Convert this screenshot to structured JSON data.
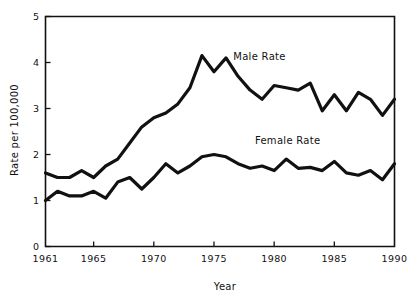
{
  "chart_data": {
    "type": "line",
    "title": "",
    "xlabel": "Year",
    "ylabel": "Rate per 100,000",
    "xlim": [
      1961,
      1990
    ],
    "ylim": [
      0,
      5
    ],
    "grid": false,
    "legend_position": "inline-annotation",
    "x_ticks": [
      "1961",
      "1965",
      "1970",
      "1975",
      "1980",
      "1985",
      "1990"
    ],
    "x_tick_values": [
      1961,
      1965,
      1970,
      1975,
      1980,
      1985,
      1990
    ],
    "y_ticks": [
      "0",
      "1",
      "2",
      "3",
      "4",
      "5"
    ],
    "y_tick_values": [
      0,
      1,
      2,
      3,
      4,
      5
    ],
    "x": [
      1961,
      1962,
      1963,
      1964,
      1965,
      1966,
      1967,
      1968,
      1969,
      1970,
      1971,
      1972,
      1973,
      1974,
      1975,
      1976,
      1977,
      1978,
      1979,
      1980,
      1981,
      1982,
      1983,
      1984,
      1985,
      1986,
      1987,
      1988,
      1989,
      1990
    ],
    "series": [
      {
        "name": "Male Rate",
        "label": "Male Rate",
        "label_x": 1976.6,
        "label_y": 4.05,
        "values": [
          1.6,
          1.5,
          1.5,
          1.65,
          1.5,
          1.75,
          1.9,
          2.25,
          2.6,
          2.8,
          2.9,
          3.1,
          3.45,
          4.15,
          3.8,
          4.1,
          3.7,
          3.4,
          3.2,
          3.5,
          3.45,
          3.4,
          3.55,
          2.95,
          3.3,
          2.95,
          3.35,
          3.2,
          2.85,
          3.2
        ]
      },
      {
        "name": "Female Rate",
        "label": "Female Rate",
        "label_x": 1978.4,
        "label_y": 2.22,
        "values": [
          1.0,
          1.2,
          1.1,
          1.1,
          1.2,
          1.05,
          1.4,
          1.5,
          1.25,
          1.5,
          1.8,
          1.6,
          1.75,
          1.95,
          2.0,
          1.95,
          1.8,
          1.7,
          1.75,
          1.65,
          1.9,
          1.7,
          1.72,
          1.65,
          1.85,
          1.6,
          1.55,
          1.65,
          1.45,
          1.8
        ]
      }
    ]
  }
}
